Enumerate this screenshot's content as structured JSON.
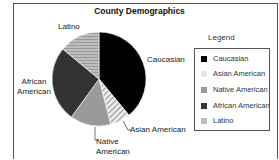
{
  "chart_data": {
    "type": "pie",
    "title": "County Demographics",
    "categories": [
      "Caucasian",
      "Asian American",
      "Native American",
      "African American",
      "Latino"
    ],
    "values": [
      39,
      7,
      14,
      26,
      14
    ],
    "colors": [
      "#000000",
      "#e8e8e8",
      "#9a9a9a",
      "#333333",
      "#b0b0b0"
    ],
    "patterns": [
      "solid",
      "diagonal-stripes",
      "solid",
      "solid",
      "horizontal-stripes"
    ],
    "start_angle": "12 o'clock, clockwise",
    "legend": {
      "title": "Legend",
      "position": "right",
      "entries": [
        "Caucasian",
        "Asian American",
        "Native American",
        "African American",
        "Latino"
      ]
    },
    "slice_labels": [
      "Caucasian",
      "Asian American",
      "Native American",
      "African American",
      "Latino"
    ]
  },
  "labels": {
    "title": "County Demographics",
    "latino": "Latino",
    "caucasian": "Caucasian",
    "african1": "African",
    "african2": "American",
    "asian": "Asian American",
    "native1": "Native",
    "native2": "American"
  },
  "legend": {
    "title": "Legend",
    "items": [
      "Caucasian",
      "Asian American",
      "Native American",
      "African American",
      "Latino"
    ]
  }
}
